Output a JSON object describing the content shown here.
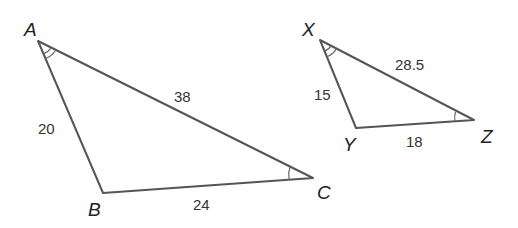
{
  "diagram": {
    "triangles": [
      {
        "name": "ABC",
        "vertices": {
          "A": {
            "label": "A",
            "x": 38,
            "y": 41
          },
          "B": {
            "label": "B",
            "x": 103,
            "y": 193
          },
          "C": {
            "label": "C",
            "x": 313,
            "y": 178
          }
        },
        "sides": {
          "AB": "20",
          "AC": "38",
          "BC": "24"
        },
        "angle_marks": {
          "A": "double-arc",
          "C": "single-arc"
        }
      },
      {
        "name": "XYZ",
        "vertices": {
          "X": {
            "label": "X",
            "x": 320,
            "y": 40
          },
          "Y": {
            "label": "Y",
            "x": 356,
            "y": 128
          },
          "Z": {
            "label": "Z",
            "x": 474,
            "y": 120
          }
        },
        "sides": {
          "XY": "15",
          "XZ": "28.5",
          "YZ": "18"
        },
        "angle_marks": {
          "X": "double-arc",
          "Z": "single-arc"
        }
      }
    ]
  }
}
